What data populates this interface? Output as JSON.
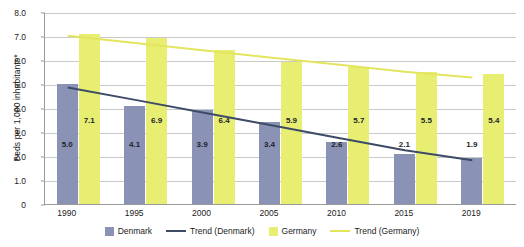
{
  "chart_data": {
    "type": "bar",
    "title": "",
    "subtitle": "",
    "xlabel": "",
    "ylabel": "Beds per 1,000 inhabitants*",
    "categories": [
      "1990",
      "1995",
      "2000",
      "2005",
      "2010",
      "2015",
      "2019"
    ],
    "series": [
      {
        "name": "Denmark",
        "type": "bar",
        "color": "#8a93b5",
        "values": [
          5.0,
          4.1,
          3.9,
          3.4,
          2.6,
          2.1,
          1.9
        ]
      },
      {
        "name": "Germany",
        "type": "bar",
        "color": "#e8ee72",
        "values": [
          7.1,
          6.9,
          6.4,
          5.9,
          5.7,
          5.5,
          5.4
        ]
      },
      {
        "name": "Trend (Denmark)",
        "type": "line",
        "color": "#3d4b66",
        "values": [
          4.9,
          4.38,
          3.85,
          3.33,
          2.8,
          2.28,
          1.86
        ]
      },
      {
        "name": "Trend (Germany)",
        "type": "line",
        "color": "#e3e55f",
        "values": [
          7.05,
          6.75,
          6.45,
          6.15,
          5.85,
          5.55,
          5.31
        ]
      }
    ],
    "ylim": [
      0,
      8.0
    ],
    "ytick_step": 1.0,
    "ytick_labels": [
      "8.0",
      "7.0",
      "6.0",
      "5.0",
      "4.0",
      "3.0",
      "2.0",
      "1.0",
      "0"
    ],
    "ytick_values": [
      8.0,
      7.0,
      6.0,
      5.0,
      4.0,
      3.0,
      2.0,
      1.0,
      0
    ],
    "grid": true,
    "legend_position": "bottom",
    "data_labels": {
      "Denmark": [
        "5.0",
        "4.1",
        "3.9",
        "3.4",
        "2.6",
        "2.1",
        "1.9"
      ],
      "Germany": [
        "7.1",
        "6.9",
        "6.4",
        "5.9",
        "5.7",
        "5.5",
        "5.4"
      ]
    }
  },
  "legend": {
    "items": [
      {
        "label": "Denmark",
        "kind": "swatch",
        "color": "#8a93b5"
      },
      {
        "label": "Trend (Denmark)",
        "kind": "line",
        "color": "#3d4b66"
      },
      {
        "label": "Germany",
        "kind": "swatch",
        "color": "#e8ee72"
      },
      {
        "label": "Trend (Germany)",
        "kind": "line",
        "color": "#e3e55f"
      }
    ]
  }
}
